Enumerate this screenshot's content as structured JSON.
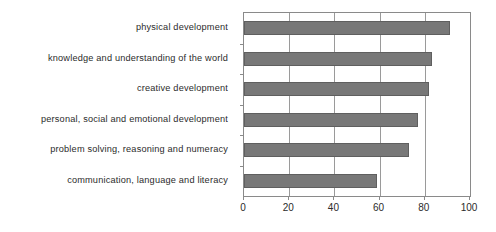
{
  "chart_data": {
    "type": "bar",
    "orientation": "horizontal",
    "title": "",
    "xlabel": "",
    "ylabel": "",
    "xlim": [
      0,
      100
    ],
    "xticks": [
      0,
      20,
      40,
      60,
      80,
      100
    ],
    "grid": true,
    "legend": "none",
    "categories": [
      "physical development",
      "knowledge and understanding of the world",
      "creative development",
      "personal, social and emotional development",
      "problem solving, reasoning and numeracy",
      "communication, language and literacy"
    ],
    "values": [
      91,
      83,
      82,
      77,
      73,
      59
    ],
    "bar_color": "#787878",
    "bar_border_color": "#5f5f5f",
    "axis_color": "#8a8a8a",
    "text_color": "#2b2b2b"
  }
}
